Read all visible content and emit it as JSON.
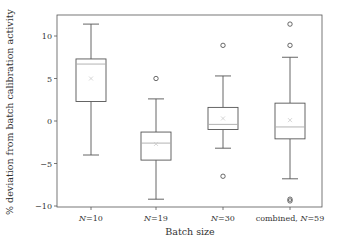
{
  "chart_data": {
    "type": "box",
    "title": "",
    "xlabel": "Batch size",
    "ylabel": "% deviation from batch calibration activity",
    "ylim": [
      -10.2,
      12.8
    ],
    "yticks": [
      -10,
      -5,
      0,
      5,
      10
    ],
    "ytick_labels": [
      "−10",
      "−5",
      "0",
      "5",
      "10"
    ],
    "grid": false,
    "legend": null,
    "categories": [
      "N=10",
      "N=19",
      "N=30",
      "combined, N=59"
    ],
    "category_labels": [
      {
        "prefix": "",
        "italic": "N",
        "suffix": "=10"
      },
      {
        "prefix": "",
        "italic": "N",
        "suffix": "=19"
      },
      {
        "prefix": "",
        "italic": "N",
        "suffix": "=30"
      },
      {
        "prefix": "combined, ",
        "italic": "N",
        "suffix": "=59"
      }
    ],
    "boxes": [
      {
        "name": "N=10",
        "whisker_low": -4.0,
        "q1": 2.3,
        "median": 6.7,
        "q3": 7.3,
        "whisker_high": 11.4,
        "mean": 5.0,
        "outliers": []
      },
      {
        "name": "N=19",
        "whisker_low": -9.2,
        "q1": -4.6,
        "median": -2.6,
        "q3": -1.3,
        "whisker_high": 2.6,
        "mean": -2.7,
        "outliers": [
          5.0
        ]
      },
      {
        "name": "N=30",
        "whisker_low": -3.2,
        "q1": -1.0,
        "median": -0.4,
        "q3": 1.6,
        "whisker_high": 5.3,
        "mean": 0.3,
        "outliers": [
          8.9,
          -6.5
        ]
      },
      {
        "name": "combined, N=59",
        "whisker_low": -6.8,
        "q1": -2.1,
        "median": -0.7,
        "q3": 2.1,
        "whisker_high": 7.5,
        "mean": 0.1,
        "outliers": [
          11.4,
          8.9,
          -9.2,
          -9.4
        ]
      }
    ],
    "colors": {
      "box": "#555555",
      "median": "#aaaaaa",
      "mean_marker": "#cccccc",
      "outlier": "#444444",
      "axis": "#555555"
    }
  }
}
